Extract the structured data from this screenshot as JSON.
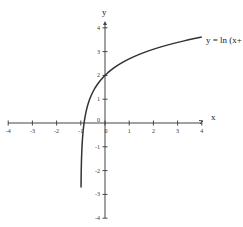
{
  "chart_data": {
    "type": "line",
    "title": "",
    "xlabel": "x",
    "ylabel": "y",
    "xlim": [
      -4,
      4
    ],
    "ylim": [
      -4,
      4
    ],
    "grid": false,
    "x_ticks": [
      "-4",
      "-3",
      "-2",
      "-1",
      "0",
      "1",
      "2",
      "3",
      "4"
    ],
    "y_ticks": [
      "4",
      "3",
      "2",
      "1",
      "0",
      "-1",
      "-2",
      "-3",
      "-4"
    ],
    "annotation": "y = ln (x+",
    "series": [
      {
        "name": "y = ln(x+1) + 2",
        "x": [
          -0.991,
          -0.98,
          -0.95,
          -0.9,
          -0.8,
          -0.6,
          -0.4,
          -0.2,
          0,
          0.5,
          1,
          1.5,
          2,
          2.5,
          3,
          3.5,
          4
        ],
        "y": [
          -2.71,
          -1.91,
          -1.0,
          -0.3,
          0.39,
          1.08,
          1.49,
          1.78,
          2.0,
          2.41,
          2.69,
          2.92,
          3.1,
          3.25,
          3.39,
          3.5,
          3.61
        ]
      }
    ]
  },
  "colors": {
    "curve": "#333333",
    "axis": "#444444",
    "background": "#ffffff"
  }
}
